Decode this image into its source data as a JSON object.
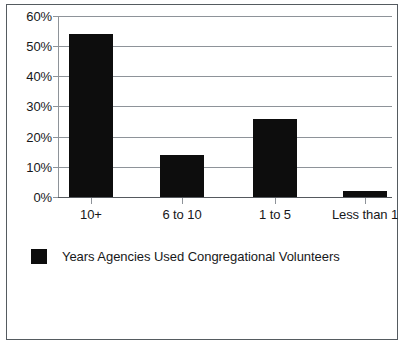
{
  "chart_data": {
    "type": "bar",
    "title": "",
    "subtitle": "",
    "xlabel": "",
    "ylabel": "",
    "categories": [
      "10+",
      "6 to 10",
      "1 to 5",
      "Less than 1"
    ],
    "values": [
      54,
      14,
      26,
      2
    ],
    "series": [
      {
        "name": "Years Agencies Used Congregational Volunteers",
        "values": [
          54,
          14,
          26,
          2
        ],
        "color": "#0d0d0d"
      }
    ],
    "ylim": [
      0,
      60
    ],
    "y_ticks": [
      0,
      10,
      20,
      30,
      40,
      50,
      60
    ],
    "y_tick_labels": [
      "0%",
      "10%",
      "20%",
      "30%",
      "40%",
      "50%",
      "60%"
    ],
    "grid": true,
    "grid_axis": "y",
    "legend": [
      "Years Agencies Used Congregational Volunteers"
    ],
    "legend_position": "bottom-left",
    "bar_color": "#0d0d0d",
    "annotations": []
  },
  "legend": {
    "label": "Years Agencies Used Congregational Volunteers"
  },
  "colors": {
    "bar": "#0d0d0d",
    "gridline": "#8e9399",
    "border": "#555b60",
    "text": "#17181a",
    "background": "#ffffff"
  }
}
